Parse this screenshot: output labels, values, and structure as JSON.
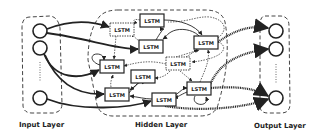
{
  "diagram": {
    "type": "recurrent-neural-network",
    "layers": [
      {
        "id": "input",
        "label": "Input Layer",
        "nodes": 3
      },
      {
        "id": "hidden",
        "label": "Hidden Layer",
        "cell_label": "LSTM",
        "cells": 10
      },
      {
        "id": "output",
        "label": "Output Layer",
        "nodes": 3
      }
    ],
    "input_nodes": [
      {
        "cx": 40,
        "cy": 31
      },
      {
        "cx": 40,
        "cy": 48
      },
      {
        "cx": 40,
        "cy": 98
      }
    ],
    "output_nodes": [
      {
        "cx": 276,
        "cy": 31
      },
      {
        "cx": 276,
        "cy": 49
      },
      {
        "cx": 276,
        "cy": 98
      }
    ],
    "lstm_cells": [
      {
        "id": "c1",
        "x": 110,
        "y": 23,
        "dotted": true
      },
      {
        "id": "c2",
        "x": 140,
        "y": 14,
        "dotted": false
      },
      {
        "id": "c3",
        "x": 139,
        "y": 40,
        "dotted": false
      },
      {
        "id": "c4",
        "x": 194,
        "y": 36,
        "dotted": false
      },
      {
        "id": "c5",
        "x": 100,
        "y": 60,
        "dotted": false
      },
      {
        "id": "c6",
        "x": 166,
        "y": 57,
        "dotted": true
      },
      {
        "id": "c7",
        "x": 131,
        "y": 70,
        "dotted": false
      },
      {
        "id": "c8",
        "x": 105,
        "y": 88,
        "dotted": false
      },
      {
        "id": "c9",
        "x": 152,
        "y": 93,
        "dotted": false
      },
      {
        "id": "c10",
        "x": 187,
        "y": 82,
        "dotted": false
      }
    ],
    "cell_text": "LSTM",
    "labels": {
      "input": "Input Layer",
      "hidden": "Hidden Layer",
      "output": "Output Layer"
    },
    "colors": {
      "stroke": "#222222",
      "background": "#ffffff",
      "dash": "#444444"
    }
  }
}
